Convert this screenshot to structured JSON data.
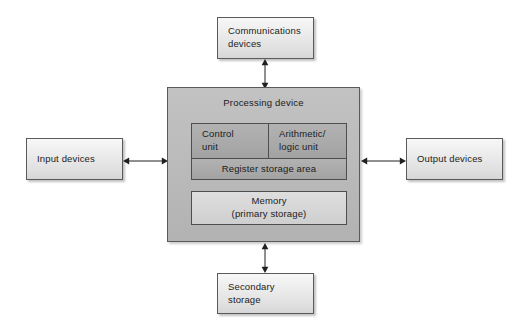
{
  "diagram": {
    "center": {
      "label": "Processing device",
      "cells": {
        "control_unit": "Control\nunit",
        "arithmetic_logic_unit": "Arithmetic/\nlogic unit",
        "register_storage_area": "Register storage area",
        "memory": "Memory\n(primary storage)"
      }
    },
    "peripherals": {
      "communications": "Communications\ndevices",
      "input": "Input devices",
      "output": "Output devices",
      "secondary": "Secondary\nstorage"
    },
    "connectors": [
      {
        "name": "communications-to-processing",
        "type": "double-arrow",
        "orientation": "vertical"
      },
      {
        "name": "input-to-processing",
        "type": "double-arrow",
        "orientation": "horizontal"
      },
      {
        "name": "processing-to-output",
        "type": "double-arrow",
        "orientation": "horizontal"
      },
      {
        "name": "processing-to-secondary",
        "type": "double-arrow",
        "orientation": "vertical"
      }
    ],
    "colors": {
      "stroke": "#5a5a5a",
      "peripheral_fill": "#ededed",
      "processing_fill": "#bcbcbc",
      "cpu_cell_fill": "#a9a9a9",
      "memory_fill": "#d6d6d6",
      "text": "#1b1b1b",
      "background": "#ffffff"
    }
  }
}
